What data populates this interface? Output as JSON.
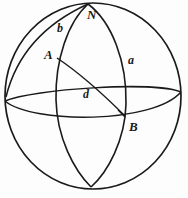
{
  "figure": {
    "kind": "spherical-triangle-diagram",
    "canvas": {
      "width": 188,
      "height": 198
    },
    "colors": {
      "background": "#fdfdfd",
      "stroke": "#1a1a1a",
      "label": "#1a1a1a"
    },
    "labels": {
      "north_pole": "N",
      "vertex_a": "A",
      "vertex_b": "B",
      "side_a": "a",
      "side_b": "b",
      "side_d": "d"
    },
    "points": {
      "north_pole": {
        "x": 88,
        "y": 4
      },
      "south_pole": {
        "x": 91,
        "y": 187
      },
      "vertex_a": {
        "x": 57,
        "y": 58
      },
      "vertex_b": {
        "x": 124,
        "y": 117
      },
      "sphere_center": {
        "x": 93,
        "y": 96
      },
      "sphere_radius_x": 89,
      "sphere_radius_y": 94
    },
    "elements": [
      {
        "name": "sphere-outline",
        "type": "circle"
      },
      {
        "name": "equator-arc",
        "type": "ellipse-arc"
      },
      {
        "name": "meridian-through-a",
        "type": "great-circle-arc"
      },
      {
        "name": "meridian-through-b",
        "type": "great-circle-arc"
      },
      {
        "name": "arc-side-d",
        "type": "great-circle-arc"
      }
    ]
  }
}
